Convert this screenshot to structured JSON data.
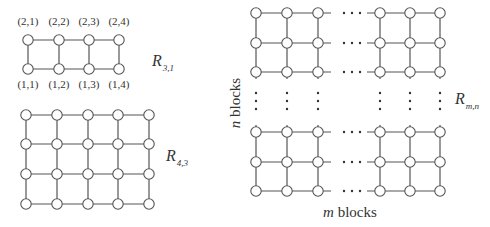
{
  "figure": {
    "colors": {
      "stroke": "#555555",
      "text": "#333333",
      "background": "#ffffff"
    },
    "node_radius": 5.2
  },
  "graph_r31": {
    "name": "R",
    "subscript": "3,1",
    "label_pos": [
      152,
      66
    ],
    "xs": [
      28,
      59,
      89,
      119
    ],
    "ys": [
      40,
      69
    ],
    "top_labels": [
      "(2,1)",
      "(2,2)",
      "(2,3)",
      "(2,4)"
    ],
    "bottom_labels": [
      "(1,1)",
      "(1,2)",
      "(1,3)",
      "(1,4)"
    ],
    "top_label_y": 25,
    "bottom_label_y": 88
  },
  "graph_r43": {
    "name": "R",
    "subscript": "4,3",
    "label_pos": [
      166,
      161
    ],
    "xs": [
      26,
      57,
      88,
      118,
      149
    ],
    "ys": [
      115,
      144,
      174,
      204
    ]
  },
  "graph_rmn": {
    "name": "R",
    "subscript": "m,n",
    "label_pos": [
      455,
      104
    ],
    "left_xs": [
      256,
      287,
      318
    ],
    "right_xs": [
      380,
      410,
      440
    ],
    "top_ys": [
      13,
      43,
      72
    ],
    "bottom_ys": [
      132,
      162,
      191
    ],
    "hdots_x": [
      344,
      352,
      360
    ],
    "vdots_y": [
      93,
      101,
      109
    ],
    "x_axis_label": {
      "italic": "m",
      "text": " blocks",
      "pos": [
        350,
        217
      ]
    },
    "y_axis_label": {
      "italic": "n",
      "text": " blocks",
      "pos": [
        240,
        103
      ]
    }
  }
}
